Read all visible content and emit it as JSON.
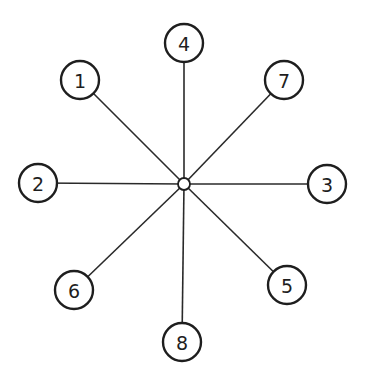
{
  "diagram": {
    "type": "star-graph",
    "hub": {
      "x": 184,
      "y": 184,
      "r": 6
    },
    "node_radius": 19,
    "nodes": [
      {
        "label": "1",
        "x": 80,
        "y": 80
      },
      {
        "label": "2",
        "x": 38,
        "y": 183
      },
      {
        "label": "3",
        "x": 327,
        "y": 184
      },
      {
        "label": "4",
        "x": 184,
        "y": 43
      },
      {
        "label": "5",
        "x": 287,
        "y": 285
      },
      {
        "label": "6",
        "x": 74,
        "y": 290
      },
      {
        "label": "7",
        "x": 284,
        "y": 80
      },
      {
        "label": "8",
        "x": 182,
        "y": 342
      }
    ],
    "edges": [
      [
        "hub",
        "1"
      ],
      [
        "hub",
        "2"
      ],
      [
        "hub",
        "3"
      ],
      [
        "hub",
        "4"
      ],
      [
        "hub",
        "5"
      ],
      [
        "hub",
        "6"
      ],
      [
        "hub",
        "7"
      ],
      [
        "hub",
        "8"
      ]
    ]
  }
}
